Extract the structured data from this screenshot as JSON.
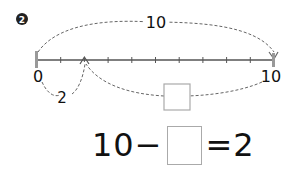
{
  "problem": {
    "number_badge": "2",
    "number_line": {
      "start_label": "0",
      "end_label": "10",
      "ticks": 11,
      "marked_value": "2",
      "top_arc_label": "10",
      "bottom_small_arc_label": "2",
      "bottom_large_arc_label": ""
    },
    "equation": {
      "left": "10",
      "operator": "−",
      "blank": "",
      "equals": "=",
      "right": "2"
    }
  },
  "colors": {
    "line": "#555555",
    "dash": "#666666",
    "endpoint": "#999999",
    "box_border": "#aaaaaa"
  }
}
